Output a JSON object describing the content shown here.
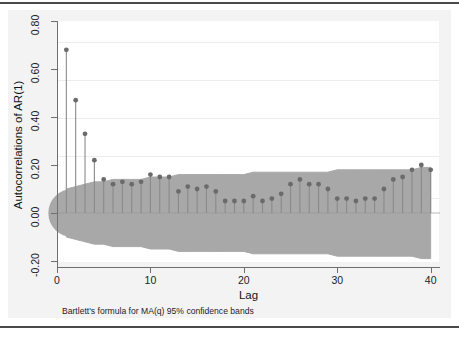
{
  "figure": {
    "axis_titles": {
      "y": "Autocorrelations of AR(1)",
      "x": "Lag"
    },
    "note": "Bartlett's formula for MA(q) 95% confidence bands",
    "colors": {
      "band_fill": "#a8a8a8",
      "spike_line": "#8a8a8a",
      "marker": "#6b6b6b",
      "axis": "#6f6f6f",
      "graph_region": "#f3f3f3",
      "plot_region": "#ffffff"
    }
  },
  "chart_data": {
    "type": "bar",
    "title": "",
    "subtitle": "",
    "xlabel": "Lag",
    "ylabel": "Autocorrelations of AR(1)",
    "xlim": [
      0,
      41
    ],
    "ylim": [
      -0.2,
      0.8
    ],
    "xticks": [
      0,
      10,
      20,
      30,
      40
    ],
    "xticklabels": [
      "0",
      "10",
      "20",
      "30",
      "40"
    ],
    "yticks": [
      -0.2,
      0.0,
      0.2,
      0.4,
      0.6,
      0.8
    ],
    "yticklabels": [
      "-0.20",
      "0.00",
      "0.20",
      "0.40",
      "0.60",
      "0.80"
    ],
    "grid": false,
    "legend": null,
    "annotations": [
      "Bartlett's formula for MA(q) 95% confidence bands"
    ],
    "x": [
      1,
      2,
      3,
      4,
      5,
      6,
      7,
      8,
      9,
      10,
      11,
      12,
      13,
      14,
      15,
      16,
      17,
      18,
      19,
      20,
      21,
      22,
      23,
      24,
      25,
      26,
      27,
      28,
      29,
      30,
      31,
      32,
      33,
      34,
      35,
      36,
      37,
      38,
      39,
      40
    ],
    "values": [
      0.68,
      0.47,
      0.33,
      0.22,
      0.14,
      0.12,
      0.13,
      0.12,
      0.13,
      0.16,
      0.15,
      0.15,
      0.09,
      0.11,
      0.1,
      0.11,
      0.09,
      0.05,
      0.05,
      0.05,
      0.07,
      0.05,
      0.06,
      0.08,
      0.12,
      0.14,
      0.12,
      0.12,
      0.1,
      0.06,
      0.06,
      0.05,
      0.06,
      0.06,
      0.1,
      0.14,
      0.15,
      0.18,
      0.2,
      0.18
    ],
    "confidence_band": {
      "label": "Bartlett 95% confidence bands",
      "upper": [
        0.1,
        0.11,
        0.12,
        0.13,
        0.13,
        0.14,
        0.14,
        0.14,
        0.14,
        0.15,
        0.15,
        0.15,
        0.16,
        0.16,
        0.16,
        0.16,
        0.16,
        0.16,
        0.16,
        0.16,
        0.17,
        0.17,
        0.17,
        0.17,
        0.17,
        0.17,
        0.17,
        0.17,
        0.17,
        0.18,
        0.18,
        0.18,
        0.18,
        0.18,
        0.18,
        0.18,
        0.18,
        0.18,
        0.19,
        0.19
      ],
      "lower": [
        -0.1,
        -0.11,
        -0.12,
        -0.13,
        -0.13,
        -0.14,
        -0.14,
        -0.14,
        -0.14,
        -0.15,
        -0.15,
        -0.15,
        -0.16,
        -0.16,
        -0.16,
        -0.16,
        -0.16,
        -0.16,
        -0.16,
        -0.16,
        -0.17,
        -0.17,
        -0.17,
        -0.17,
        -0.17,
        -0.17,
        -0.17,
        -0.17,
        -0.17,
        -0.18,
        -0.18,
        -0.18,
        -0.18,
        -0.18,
        -0.18,
        -0.18,
        -0.18,
        -0.18,
        -0.19,
        -0.19
      ]
    }
  }
}
